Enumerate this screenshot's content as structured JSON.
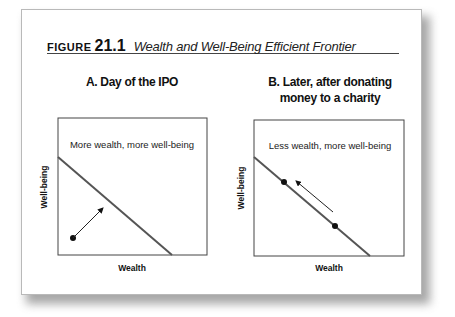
{
  "figure": {
    "label_word": "FIGURE",
    "label_number": "21.1",
    "caption": "Wealth and Well-Being Efficient Frontier"
  },
  "panels": [
    {
      "title_line1": "A. Day of the IPO",
      "title_line2": "",
      "region_label": "More wealth, more well-being",
      "x_label": "Wealth",
      "y_label": "Well-being"
    },
    {
      "title_line1": "B. Later, after donating",
      "title_line2": "money to a charity",
      "region_label": "Less wealth, more well-being",
      "x_label": "Wealth",
      "y_label": "Well-being"
    }
  ],
  "colors": {
    "frontier_line": "#555555",
    "box_border": "#444444",
    "point": "#111111"
  }
}
